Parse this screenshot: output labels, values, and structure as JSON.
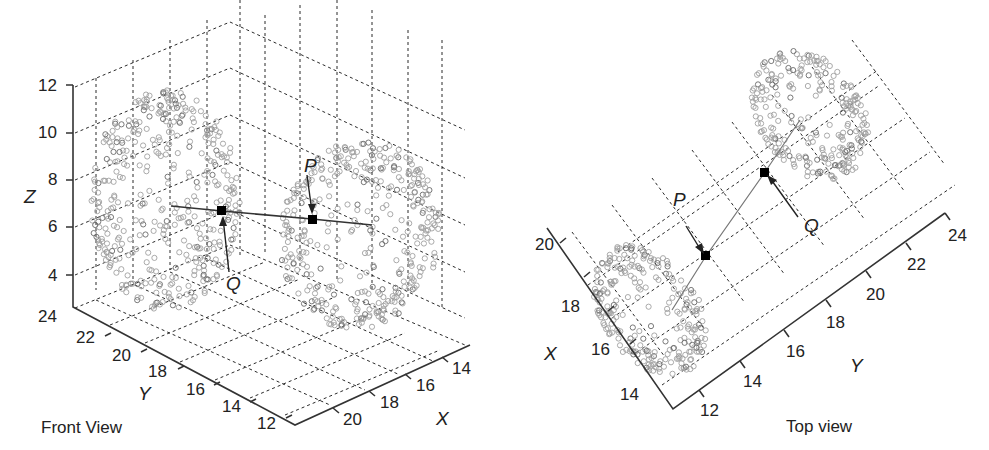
{
  "chart_data": [
    {
      "type": "scatter",
      "subtype": "3d-scatter",
      "title": "Front View",
      "xlabel": "X",
      "ylabel": "Y",
      "zlabel": "Z",
      "x_ticks": [
        "14",
        "16",
        "18",
        "20"
      ],
      "y_ticks": [
        "12",
        "14",
        "16",
        "18",
        "20",
        "22",
        "24"
      ],
      "z_ticks": [
        "4",
        "6",
        "8",
        "10",
        "12"
      ],
      "xlim": [
        12,
        22
      ],
      "ylim": [
        12,
        24
      ],
      "zlim": [
        3,
        12
      ],
      "grid": true,
      "series": [
        {
          "name": "point cloud",
          "marker": "open-circle",
          "color": "#a0a0a0",
          "description": "two clusters of open circles"
        },
        {
          "name": "P",
          "marker": "filled-square",
          "color": "#000000"
        },
        {
          "name": "Q",
          "marker": "filled-square",
          "color": "#000000"
        }
      ],
      "annotations": [
        {
          "label": "P",
          "arrow_to": "P"
        },
        {
          "label": "Q",
          "arrow_to": "Q"
        }
      ],
      "line": "straight line through Q and P"
    },
    {
      "type": "scatter",
      "subtype": "top-view-projection",
      "title": "Top view",
      "xlabel": "X",
      "ylabel": "Y",
      "x_ticks": [
        "14",
        "16",
        "18",
        "20"
      ],
      "y_ticks": [
        "12",
        "14",
        "16",
        "18",
        "20",
        "22",
        "24"
      ],
      "grid": true,
      "series": [
        {
          "name": "point cloud",
          "marker": "open-circle",
          "color": "#a0a0a0"
        },
        {
          "name": "P",
          "marker": "filled-square",
          "color": "#000000"
        },
        {
          "name": "Q",
          "marker": "filled-square",
          "color": "#000000"
        }
      ],
      "annotations": [
        {
          "label": "P",
          "arrow_to": "P"
        },
        {
          "label": "Q",
          "arrow_to": "Q"
        }
      ],
      "line": "straight line through P and Q"
    }
  ],
  "front": {
    "caption": "Front View",
    "x_label": "X",
    "y_label": "Y",
    "z_label": "Z",
    "z_ticks": [
      "12",
      "10",
      "8",
      "6",
      "4"
    ],
    "y_ticks": [
      "24",
      "22",
      "20",
      "18",
      "16",
      "14",
      "12"
    ],
    "x_ticks": [
      "14",
      "16",
      "18",
      "20"
    ],
    "p_label": "P",
    "q_label": "Q"
  },
  "top": {
    "caption": "Top view",
    "x_label": "X",
    "y_label": "Y",
    "x_ticks": [
      "20",
      "18",
      "16",
      "14"
    ],
    "y_ticks": [
      "12",
      "14",
      "16",
      "18",
      "20",
      "22",
      "24"
    ],
    "p_label": "P",
    "q_label": "Q"
  }
}
